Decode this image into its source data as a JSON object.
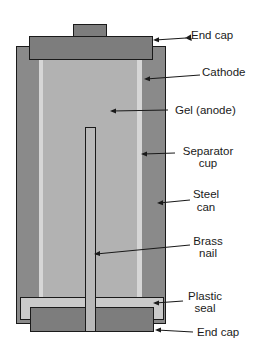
{
  "diagram": {
    "colors": {
      "steel_can": "#8a8a8a",
      "cathode": "#8a8a8a",
      "separator": "#d6d6d6",
      "gel": "#b2b2b2",
      "end_cap": "#7d7d7d",
      "plastic_seal": "#cacaca",
      "nail": "#b9b9b9",
      "outline": "#1a1a1a"
    },
    "labels": {
      "top_end_cap": "End cap",
      "cathode": "Cathode",
      "gel": "Gel (anode)",
      "separator_line1": "Separator",
      "separator_line2": "cup",
      "steel_line1": "Steel",
      "steel_line2": "can",
      "nail_line1": "Brass",
      "nail_line2": "nail",
      "seal_line1": "Plastic",
      "seal_line2": "seal",
      "bottom_end_cap": "End cap"
    }
  }
}
